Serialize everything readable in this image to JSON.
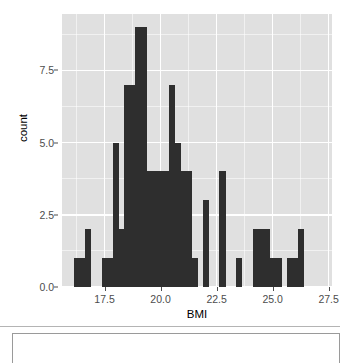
{
  "chart_data": {
    "type": "bar",
    "subtype": "histogram",
    "title": "",
    "xlabel": "BMI",
    "ylabel": "count",
    "xlim": [
      15.6,
      27.65
    ],
    "ylim": [
      0,
      9.45
    ],
    "xticks": [
      "17.5",
      "20.0",
      "22.5",
      "25.0",
      "27.5"
    ],
    "xtick_values": [
      17.5,
      20.0,
      22.5,
      25.0,
      27.5
    ],
    "yticks": [
      "0.0",
      "2.5",
      "5.0",
      "7.5"
    ],
    "ytick_values": [
      0.0,
      2.5,
      5.0,
      7.5
    ],
    "grid": true,
    "grid_color": "#ffffff",
    "panel_color": "#e0e0e0",
    "bar_color": "#2e2e2e",
    "legend": "none",
    "binwidth": 0.25,
    "bins": [
      {
        "x0": 15.875,
        "x1": 16.125,
        "count": 0
      },
      {
        "x0": 16.125,
        "x1": 16.375,
        "count": 1
      },
      {
        "x0": 16.375,
        "x1": 16.625,
        "count": 1
      },
      {
        "x0": 16.625,
        "x1": 16.875,
        "count": 2
      },
      {
        "x0": 16.875,
        "x1": 17.125,
        "count": 0
      },
      {
        "x0": 17.125,
        "x1": 17.375,
        "count": 0
      },
      {
        "x0": 17.375,
        "x1": 17.625,
        "count": 1
      },
      {
        "x0": 17.625,
        "x1": 17.875,
        "count": 1
      },
      {
        "x0": 17.875,
        "x1": 18.125,
        "count": 5
      },
      {
        "x0": 18.125,
        "x1": 18.375,
        "count": 2
      },
      {
        "x0": 18.375,
        "x1": 18.625,
        "count": 7
      },
      {
        "x0": 18.625,
        "x1": 18.875,
        "count": 7
      },
      {
        "x0": 18.875,
        "x1": 19.125,
        "count": 9
      },
      {
        "x0": 19.125,
        "x1": 19.375,
        "count": 9
      },
      {
        "x0": 19.375,
        "x1": 19.625,
        "count": 4
      },
      {
        "x0": 19.625,
        "x1": 19.875,
        "count": 4
      },
      {
        "x0": 19.875,
        "x1": 20.125,
        "count": 4
      },
      {
        "x0": 20.125,
        "x1": 20.375,
        "count": 4
      },
      {
        "x0": 20.375,
        "x1": 20.625,
        "count": 7
      },
      {
        "x0": 20.625,
        "x1": 20.875,
        "count": 5
      },
      {
        "x0": 20.875,
        "x1": 21.125,
        "count": 4
      },
      {
        "x0": 21.125,
        "x1": 21.375,
        "count": 4
      },
      {
        "x0": 21.375,
        "x1": 21.625,
        "count": 1
      },
      {
        "x0": 21.625,
        "x1": 21.875,
        "count": 0
      },
      {
        "x0": 21.875,
        "x1": 22.125,
        "count": 3
      },
      {
        "x0": 22.125,
        "x1": 22.375,
        "count": 0
      },
      {
        "x0": 22.375,
        "x1": 22.625,
        "count": 0
      },
      {
        "x0": 22.625,
        "x1": 22.875,
        "count": 4
      },
      {
        "x0": 22.875,
        "x1": 23.125,
        "count": 0
      },
      {
        "x0": 23.125,
        "x1": 23.375,
        "count": 0
      },
      {
        "x0": 23.375,
        "x1": 23.625,
        "count": 1
      },
      {
        "x0": 23.625,
        "x1": 23.875,
        "count": 0
      },
      {
        "x0": 23.875,
        "x1": 24.125,
        "count": 0
      },
      {
        "x0": 24.125,
        "x1": 24.375,
        "count": 2
      },
      {
        "x0": 24.375,
        "x1": 24.625,
        "count": 2
      },
      {
        "x0": 24.625,
        "x1": 24.875,
        "count": 2
      },
      {
        "x0": 24.875,
        "x1": 25.125,
        "count": 1
      },
      {
        "x0": 25.125,
        "x1": 25.375,
        "count": 1
      },
      {
        "x0": 25.375,
        "x1": 25.625,
        "count": 0
      },
      {
        "x0": 25.625,
        "x1": 25.875,
        "count": 1
      },
      {
        "x0": 25.875,
        "x1": 26.125,
        "count": 1
      },
      {
        "x0": 26.125,
        "x1": 26.375,
        "count": 2
      }
    ]
  }
}
